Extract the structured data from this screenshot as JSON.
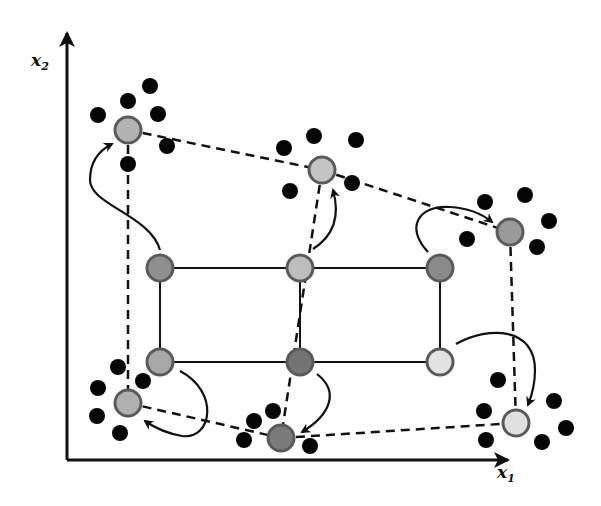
{
  "axes": {
    "x_label": "x",
    "x_subscript": "1",
    "y_label": "x",
    "y_subscript": "2",
    "origin": [
      67,
      460
    ],
    "x_end": [
      508,
      460
    ],
    "y_end": [
      67,
      33
    ]
  },
  "colors": {
    "line": "#111111",
    "dot": "#050505",
    "node_stroke": "#5a5a5a"
  },
  "grid_nodes": [
    {
      "id": "g00",
      "x": 160,
      "y": 268,
      "fill": "#8f8f8f"
    },
    {
      "id": "g01",
      "x": 300,
      "y": 268,
      "fill": "#bdbdbd"
    },
    {
      "id": "g02",
      "x": 440,
      "y": 268,
      "fill": "#8a8a8a"
    },
    {
      "id": "g10",
      "x": 160,
      "y": 362,
      "fill": "#a8a8a8"
    },
    {
      "id": "g11",
      "x": 300,
      "y": 362,
      "fill": "#737373"
    },
    {
      "id": "g12",
      "x": 440,
      "y": 362,
      "fill": "#e2e2e2"
    }
  ],
  "grid_edges": [
    [
      "g00",
      "g01"
    ],
    [
      "g01",
      "g02"
    ],
    [
      "g10",
      "g11"
    ],
    [
      "g11",
      "g12"
    ],
    [
      "g00",
      "g10"
    ],
    [
      "g01",
      "g11"
    ],
    [
      "g02",
      "g12"
    ]
  ],
  "mapped_nodes": [
    {
      "id": "m00",
      "x": 128,
      "y": 130,
      "fill": "#b3b3b3"
    },
    {
      "id": "m01",
      "x": 322,
      "y": 170,
      "fill": "#c4c4c4"
    },
    {
      "id": "m02",
      "x": 510,
      "y": 232,
      "fill": "#9a9a9a"
    },
    {
      "id": "m10",
      "x": 128,
      "y": 403,
      "fill": "#b0b0b0"
    },
    {
      "id": "m11",
      "x": 281,
      "y": 438,
      "fill": "#7a7a7a"
    },
    {
      "id": "m12",
      "x": 516,
      "y": 423,
      "fill": "#e0e0e0"
    }
  ],
  "mapped_edges": [
    [
      "m00",
      "m01"
    ],
    [
      "m01",
      "m02"
    ],
    [
      "m10",
      "m11"
    ],
    [
      "m11",
      "m12"
    ],
    [
      "m00",
      "m10"
    ],
    [
      "m01",
      "m11"
    ],
    [
      "m02",
      "m12"
    ]
  ],
  "arrows": [
    {
      "from": "g00",
      "to": "m00",
      "path": "M160,250 C150,215 90,205 90,180 C90,160 100,150 112,144"
    },
    {
      "from": "g01",
      "to": "m01",
      "path": "M313,249 C335,235 340,215 333,190"
    },
    {
      "from": "g02",
      "to": "m02",
      "path": "M428,252 C405,228 418,205 450,207 C470,208 482,214 492,222"
    },
    {
      "from": "g10",
      "to": "m10",
      "path": "M180,371 C220,392 212,440 182,436 C165,433 155,428 145,421"
    },
    {
      "from": "g11",
      "to": "m11",
      "path": "M317,374 C340,392 330,415 302,432"
    },
    {
      "from": "g12",
      "to": "m12",
      "path": "M456,344 C490,325 535,328 535,370 C535,385 532,395 528,405"
    }
  ],
  "neighbor_dots": [
    {
      "x": 150,
      "y": 86
    },
    {
      "x": 128,
      "y": 101
    },
    {
      "x": 98,
      "y": 115
    },
    {
      "x": 158,
      "y": 114
    },
    {
      "x": 167,
      "y": 146
    },
    {
      "x": 128,
      "y": 164
    },
    {
      "x": 314,
      "y": 136
    },
    {
      "x": 284,
      "y": 148
    },
    {
      "x": 356,
      "y": 140
    },
    {
      "x": 290,
      "y": 191
    },
    {
      "x": 352,
      "y": 183
    },
    {
      "x": 485,
      "y": 202
    },
    {
      "x": 525,
      "y": 195
    },
    {
      "x": 549,
      "y": 221
    },
    {
      "x": 467,
      "y": 239
    },
    {
      "x": 537,
      "y": 247
    },
    {
      "x": 118,
      "y": 367
    },
    {
      "x": 98,
      "y": 388
    },
    {
      "x": 143,
      "y": 381
    },
    {
      "x": 97,
      "y": 416
    },
    {
      "x": 120,
      "y": 433
    },
    {
      "x": 273,
      "y": 411
    },
    {
      "x": 254,
      "y": 421
    },
    {
      "x": 244,
      "y": 440
    },
    {
      "x": 310,
      "y": 446
    },
    {
      "x": 498,
      "y": 380
    },
    {
      "x": 484,
      "y": 411
    },
    {
      "x": 554,
      "y": 401
    },
    {
      "x": 566,
      "y": 428
    },
    {
      "x": 486,
      "y": 440
    },
    {
      "x": 542,
      "y": 442
    }
  ]
}
